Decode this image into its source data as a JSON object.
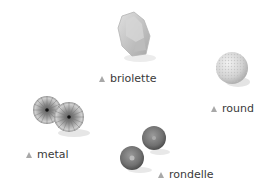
{
  "items": [
    {
      "id": "briolette",
      "label": "briolette",
      "shape": "faceted-briolette"
    },
    {
      "id": "round",
      "label": "round",
      "shape": "textured-sphere"
    },
    {
      "id": "metal",
      "label": "metal",
      "shape": "fluted-metal-pair"
    },
    {
      "id": "rondelle",
      "label": "rondelle",
      "shape": "rondelle-pair"
    }
  ],
  "colors": {
    "marker": "#a8a8a8",
    "text": "#3a3a3a",
    "background": "#ffffff"
  }
}
